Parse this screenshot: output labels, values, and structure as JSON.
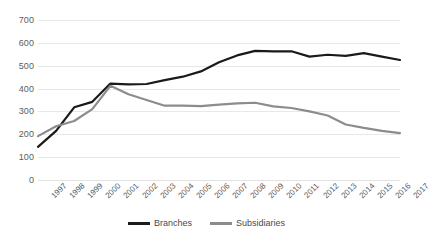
{
  "chart_data": {
    "type": "line",
    "title": "",
    "subtitle": "",
    "xlabel": "",
    "ylabel": "",
    "ylim": [
      0,
      700
    ],
    "ytick_step": 100,
    "yticks": [
      700,
      600,
      500,
      400,
      300,
      200,
      100,
      0
    ],
    "grid": true,
    "legend_position": "bottom-center",
    "categories": [
      "1997",
      "1998",
      "1999",
      "2000",
      "2001",
      "2002",
      "2003",
      "2004",
      "2005",
      "2006",
      "2007",
      "2008",
      "2009",
      "2010",
      "2011",
      "2012",
      "2013",
      "2014",
      "2015",
      "2016",
      "2017"
    ],
    "series": [
      {
        "name": "Branches",
        "color": "#1a1a1a",
        "values": [
          145,
          215,
          318,
          342,
          422,
          418,
          420,
          437,
          452,
          475,
          515,
          545,
          565,
          563,
          563,
          540,
          548,
          543,
          555,
          540,
          525
        ]
      },
      {
        "name": "Subsidiaries",
        "color": "#8c8c8c",
        "values": [
          192,
          235,
          258,
          310,
          412,
          375,
          350,
          325,
          325,
          323,
          330,
          335,
          338,
          322,
          315,
          300,
          282,
          243,
          228,
          215,
          205
        ]
      }
    ]
  },
  "legend": {
    "entries": [
      {
        "label": "Branches",
        "color": "#1a1a1a"
      },
      {
        "label": "Subsidiaries",
        "color": "#8c8c8c"
      }
    ]
  },
  "colors": {
    "branches": "#1a1a1a",
    "subsidiaries": "#8c8c8c",
    "gridline": "#e8e8e8",
    "tick_text": "#5c5c5c",
    "background": "#ffffff"
  }
}
